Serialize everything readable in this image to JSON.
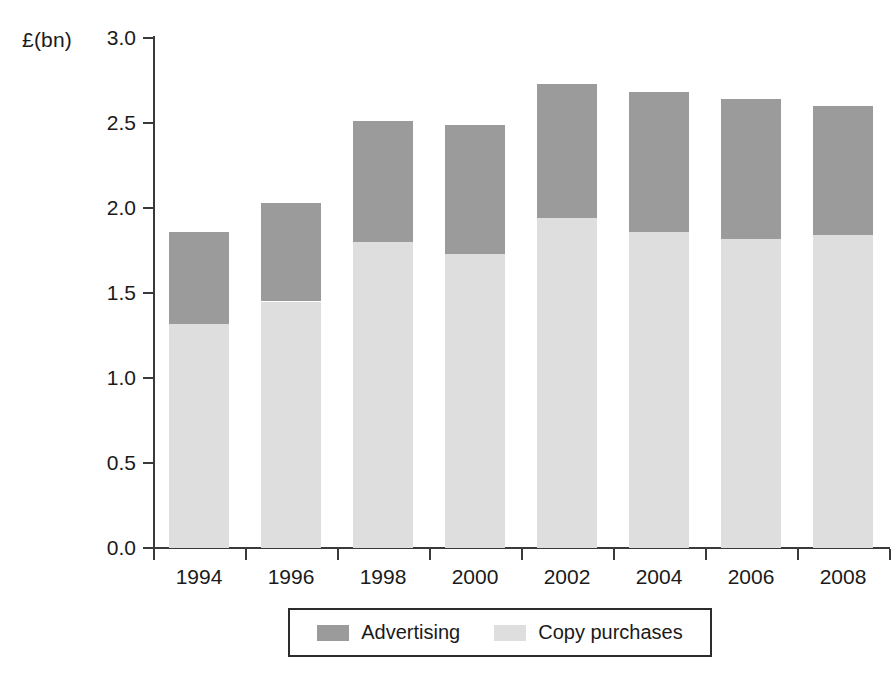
{
  "chart_data": {
    "type": "bar",
    "subtype": "stacked-vertical",
    "title": "",
    "xlabel": "",
    "ylabel": "£(bn)",
    "ylim": [
      0.0,
      3.0
    ],
    "ytick_step": 0.5,
    "grid": false,
    "legend_position": "bottom",
    "categories": [
      "1994",
      "1996",
      "1998",
      "2000",
      "2002",
      "2004",
      "2006",
      "2008"
    ],
    "series": [
      {
        "name": "Copy purchases",
        "color": "#dedede",
        "values": [
          1.32,
          1.45,
          1.8,
          1.73,
          1.94,
          1.86,
          1.82,
          1.84
        ]
      },
      {
        "name": "Advertising",
        "color": "#9b9b9b",
        "values": [
          0.54,
          0.58,
          0.71,
          0.76,
          0.79,
          0.82,
          0.82,
          0.76
        ]
      }
    ],
    "totals": [
      1.86,
      2.03,
      2.51,
      2.49,
      2.73,
      2.68,
      2.64,
      2.6
    ],
    "ytick_labels": [
      "0.0",
      "0.5",
      "1.0",
      "1.5",
      "2.0",
      "2.5",
      "3.0"
    ],
    "ytick_values": [
      0.0,
      0.5,
      1.0,
      1.5,
      2.0,
      2.5,
      3.0
    ]
  },
  "axis": {
    "y_title": "£(bn)"
  },
  "legend": {
    "entries": [
      {
        "label": "Advertising",
        "color": "#9b9b9b"
      },
      {
        "label": "Copy purchases",
        "color": "#dedede"
      }
    ]
  }
}
